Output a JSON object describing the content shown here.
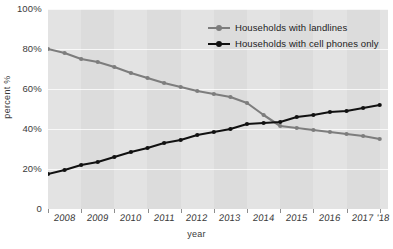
{
  "chart_data": {
    "type": "line",
    "title": "",
    "xlabel": "year",
    "ylabel": "percent %",
    "xlim": [
      2008,
      2018.25
    ],
    "ylim": [
      0,
      100
    ],
    "grid": true,
    "legend_position": "top-right",
    "ytick_labels": [
      "100%",
      "80%",
      "60%",
      "40%",
      "20%",
      "0"
    ],
    "ytick_values": [
      100,
      80,
      60,
      40,
      20,
      0
    ],
    "xtick_labels": [
      "2008",
      "2009",
      "2010",
      "2011",
      "2012",
      "2013",
      "2014",
      "2015",
      "2016",
      "2017",
      "'18"
    ],
    "xtick_values": [
      2008,
      2009,
      2010,
      2011,
      2012,
      2013,
      2014,
      2015,
      2016,
      2017,
      2018
    ],
    "x": [
      2008,
      2008.5,
      2009,
      2009.5,
      2010,
      2010.5,
      2011,
      2011.5,
      2012,
      2012.5,
      2013,
      2013.5,
      2014,
      2014.5,
      2015,
      2015.5,
      2016,
      2016.5,
      2017,
      2017.5,
      2018
    ],
    "series": [
      {
        "name": "Households with landlines",
        "color": "#7d7d7d",
        "marker": "circle",
        "values": [
          80,
          78,
          75,
          73.5,
          71,
          68,
          65.5,
          63,
          61,
          59,
          57.5,
          56,
          53,
          47,
          41.5,
          40.5,
          39.5,
          38.5,
          37.5,
          36.5,
          35
        ]
      },
      {
        "name": "Households with cell phones only",
        "color": "#111111",
        "marker": "circle",
        "values": [
          17.5,
          19.5,
          22,
          23.5,
          26,
          28.5,
          30.5,
          33,
          34.5,
          37,
          38.5,
          40,
          42.5,
          43,
          43.5,
          46,
          47,
          48.5,
          49,
          50.5,
          52
        ]
      }
    ]
  },
  "legend": {
    "items": [
      {
        "label": "Households with landlines",
        "color": "#7d7d7d"
      },
      {
        "label": "Households with cell phones only",
        "color": "#111111"
      }
    ]
  }
}
